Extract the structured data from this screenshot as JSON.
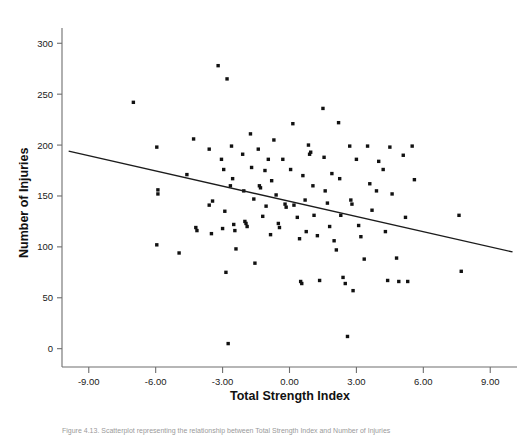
{
  "figure": {
    "background_color": "#ffffff",
    "point_color": "#111111",
    "axis_color": "#6e6e6e",
    "fit_line_color": "#1c1c1c",
    "caption": "Figure 4.13. Scatterplot representing the relationship between Total Strength Index and Number of Injuries"
  },
  "chart_data": {
    "type": "scatter",
    "title": "",
    "xlabel": "Total Strength Index",
    "ylabel": "Number of Injuries",
    "xlim": [
      -10.2,
      10.2
    ],
    "ylim": [
      -18,
      315
    ],
    "xticks": [
      -9,
      -6,
      -3,
      0,
      3,
      6,
      9
    ],
    "xtick_labels": [
      "-9.00",
      "-6.00",
      "-3.00",
      "0.00",
      "3.00",
      "6.00",
      "9.00"
    ],
    "yticks": [
      0,
      50,
      100,
      150,
      200,
      250,
      300
    ],
    "ytick_labels": [
      "0",
      "50",
      "100",
      "150",
      "200",
      "250",
      "300"
    ],
    "grid": false,
    "legend": "none",
    "fit_line": {
      "type": "linear-regression",
      "x_start": -9.9,
      "y_start": 194,
      "x_end": 10.0,
      "y_end": 95,
      "slope": -4.97,
      "intercept": 144.8
    },
    "points": [
      {
        "x": -7.0,
        "y": 242
      },
      {
        "x": -5.95,
        "y": 198
      },
      {
        "x": -5.9,
        "y": 156
      },
      {
        "x": -5.9,
        "y": 152
      },
      {
        "x": -5.95,
        "y": 102
      },
      {
        "x": -4.95,
        "y": 94
      },
      {
        "x": -4.6,
        "y": 171
      },
      {
        "x": -4.3,
        "y": 206
      },
      {
        "x": -4.2,
        "y": 119
      },
      {
        "x": -4.15,
        "y": 116
      },
      {
        "x": -3.6,
        "y": 196
      },
      {
        "x": -3.6,
        "y": 141
      },
      {
        "x": -3.5,
        "y": 113
      },
      {
        "x": -3.45,
        "y": 145
      },
      {
        "x": -3.2,
        "y": 278
      },
      {
        "x": -3.05,
        "y": 186
      },
      {
        "x": -3.0,
        "y": 118
      },
      {
        "x": -2.95,
        "y": 176
      },
      {
        "x": -2.9,
        "y": 135
      },
      {
        "x": -2.85,
        "y": 75
      },
      {
        "x": -2.8,
        "y": 265
      },
      {
        "x": -2.75,
        "y": 5
      },
      {
        "x": -2.65,
        "y": 160
      },
      {
        "x": -2.6,
        "y": 199
      },
      {
        "x": -2.55,
        "y": 167
      },
      {
        "x": -2.5,
        "y": 122
      },
      {
        "x": -2.45,
        "y": 116
      },
      {
        "x": -2.4,
        "y": 98
      },
      {
        "x": -2.1,
        "y": 191
      },
      {
        "x": -2.05,
        "y": 155
      },
      {
        "x": -2.0,
        "y": 125
      },
      {
        "x": -1.95,
        "y": 123
      },
      {
        "x": -1.9,
        "y": 120
      },
      {
        "x": -1.75,
        "y": 211
      },
      {
        "x": -1.7,
        "y": 178
      },
      {
        "x": -1.6,
        "y": 147
      },
      {
        "x": -1.55,
        "y": 84
      },
      {
        "x": -1.4,
        "y": 196
      },
      {
        "x": -1.35,
        "y": 160
      },
      {
        "x": -1.3,
        "y": 158
      },
      {
        "x": -1.2,
        "y": 130
      },
      {
        "x": -1.1,
        "y": 175
      },
      {
        "x": -1.05,
        "y": 140
      },
      {
        "x": -0.95,
        "y": 186
      },
      {
        "x": -0.85,
        "y": 112
      },
      {
        "x": -0.8,
        "y": 165
      },
      {
        "x": -0.7,
        "y": 205
      },
      {
        "x": -0.6,
        "y": 151
      },
      {
        "x": -0.5,
        "y": 123
      },
      {
        "x": -0.45,
        "y": 119
      },
      {
        "x": -0.3,
        "y": 186
      },
      {
        "x": -0.2,
        "y": 142
      },
      {
        "x": -0.15,
        "y": 139
      },
      {
        "x": 0.05,
        "y": 176
      },
      {
        "x": 0.15,
        "y": 221
      },
      {
        "x": 0.2,
        "y": 141
      },
      {
        "x": 0.35,
        "y": 129
      },
      {
        "x": 0.45,
        "y": 108
      },
      {
        "x": 0.5,
        "y": 66
      },
      {
        "x": 0.55,
        "y": 64
      },
      {
        "x": 0.6,
        "y": 170
      },
      {
        "x": 0.7,
        "y": 146
      },
      {
        "x": 0.75,
        "y": 115
      },
      {
        "x": 0.85,
        "y": 200
      },
      {
        "x": 0.9,
        "y": 191
      },
      {
        "x": 0.95,
        "y": 193
      },
      {
        "x": 1.05,
        "y": 160
      },
      {
        "x": 1.1,
        "y": 131
      },
      {
        "x": 1.25,
        "y": 111
      },
      {
        "x": 1.35,
        "y": 67
      },
      {
        "x": 1.5,
        "y": 236
      },
      {
        "x": 1.55,
        "y": 188
      },
      {
        "x": 1.6,
        "y": 155
      },
      {
        "x": 1.7,
        "y": 143
      },
      {
        "x": 1.8,
        "y": 120
      },
      {
        "x": 1.9,
        "y": 172
      },
      {
        "x": 2.0,
        "y": 106
      },
      {
        "x": 2.1,
        "y": 97
      },
      {
        "x": 2.2,
        "y": 222
      },
      {
        "x": 2.25,
        "y": 167
      },
      {
        "x": 2.3,
        "y": 131
      },
      {
        "x": 2.4,
        "y": 70
      },
      {
        "x": 2.5,
        "y": 64
      },
      {
        "x": 2.6,
        "y": 12
      },
      {
        "x": 2.7,
        "y": 199
      },
      {
        "x": 2.75,
        "y": 146
      },
      {
        "x": 2.8,
        "y": 142
      },
      {
        "x": 2.85,
        "y": 57
      },
      {
        "x": 3.0,
        "y": 186
      },
      {
        "x": 3.1,
        "y": 121
      },
      {
        "x": 3.2,
        "y": 110
      },
      {
        "x": 3.35,
        "y": 88
      },
      {
        "x": 3.5,
        "y": 199
      },
      {
        "x": 3.6,
        "y": 162
      },
      {
        "x": 3.7,
        "y": 136
      },
      {
        "x": 3.9,
        "y": 155
      },
      {
        "x": 4.0,
        "y": 184
      },
      {
        "x": 4.2,
        "y": 176
      },
      {
        "x": 4.3,
        "y": 115
      },
      {
        "x": 4.4,
        "y": 67
      },
      {
        "x": 4.5,
        "y": 198
      },
      {
        "x": 4.6,
        "y": 152
      },
      {
        "x": 4.8,
        "y": 89
      },
      {
        "x": 4.9,
        "y": 66
      },
      {
        "x": 5.1,
        "y": 190
      },
      {
        "x": 5.2,
        "y": 129
      },
      {
        "x": 5.3,
        "y": 66
      },
      {
        "x": 5.5,
        "y": 199
      },
      {
        "x": 5.6,
        "y": 166
      },
      {
        "x": 7.6,
        "y": 131
      },
      {
        "x": 7.7,
        "y": 76
      }
    ]
  }
}
